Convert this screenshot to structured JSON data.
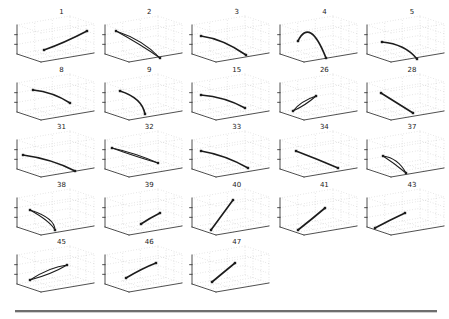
{
  "figure": {
    "background": "#ffffff",
    "kind": "grid of small 3D trajectory subplots"
  },
  "chart_data": {
    "type": "line",
    "title": "",
    "grid": "dotted",
    "ticks_labeled": false,
    "columns": 5,
    "rows": 5,
    "colors": {
      "curve": "#1c1c1c",
      "box_edge": "#3c3c3c",
      "grid_dot": "#b5b5b5",
      "title_text": "#1a1a1a",
      "divider": "#6e6e6e"
    },
    "plots": [
      {
        "label": "1",
        "style": "single",
        "points": [
          [
            32,
            42
          ],
          [
            52,
            35
          ],
          [
            75,
            23
          ]
        ]
      },
      {
        "label": "2",
        "style": "loop",
        "points": [
          [
            16,
            23
          ],
          [
            43,
            32
          ],
          [
            60,
            50
          ]
        ],
        "c2": [
          40,
          36
        ]
      },
      {
        "label": "3",
        "style": "single",
        "points": [
          [
            14,
            28
          ],
          [
            36,
            31
          ],
          [
            59,
            47
          ]
        ]
      },
      {
        "label": "4",
        "style": "single",
        "points": [
          [
            23,
            33
          ],
          [
            35,
            9
          ],
          [
            51,
            50
          ]
        ]
      },
      {
        "label": "5",
        "style": "single",
        "points": [
          [
            20,
            34
          ],
          [
            43,
            36
          ],
          [
            55,
            51
          ]
        ]
      },
      {
        "label": "8",
        "style": "single",
        "points": [
          [
            21,
            24
          ],
          [
            41,
            26
          ],
          [
            58,
            37
          ]
        ]
      },
      {
        "label": "9",
        "style": "single",
        "points": [
          [
            20,
            25
          ],
          [
            42,
            32
          ],
          [
            45,
            48
          ]
        ]
      },
      {
        "label": "15",
        "style": "single",
        "points": [
          [
            14,
            29
          ],
          [
            38,
            31
          ],
          [
            58,
            42
          ]
        ]
      },
      {
        "label": "26",
        "style": "loop",
        "points": [
          [
            18,
            45
          ],
          [
            26,
            35
          ],
          [
            41,
            30
          ]
        ],
        "c2": [
          31,
          39
        ]
      },
      {
        "label": "28",
        "style": "single",
        "points": [
          [
            19,
            27
          ],
          [
            35,
            37
          ],
          [
            51,
            47
          ]
        ]
      },
      {
        "label": "31",
        "style": "single",
        "points": [
          [
            11,
            32
          ],
          [
            40,
            36
          ],
          [
            63,
            48
          ]
        ]
      },
      {
        "label": "32",
        "style": "loop",
        "points": [
          [
            12,
            25
          ],
          [
            35,
            30
          ],
          [
            58,
            40
          ]
        ],
        "c2": [
          37,
          34
        ]
      },
      {
        "label": "33",
        "style": "single",
        "points": [
          [
            14,
            28
          ],
          [
            38,
            32
          ],
          [
            61,
            45
          ]
        ]
      },
      {
        "label": "34",
        "style": "single",
        "points": [
          [
            21,
            28
          ],
          [
            42,
            36
          ],
          [
            63,
            45
          ]
        ]
      },
      {
        "label": "37",
        "style": "loop",
        "points": [
          [
            21,
            33
          ],
          [
            36,
            35
          ],
          [
            44,
            50
          ]
        ],
        "c2": [
          32,
          40
        ]
      },
      {
        "label": "38",
        "style": "loop",
        "points": [
          [
            18,
            29
          ],
          [
            43,
            37
          ],
          [
            43,
            49
          ]
        ],
        "c2": [
          38,
          40
        ]
      },
      {
        "label": "39",
        "style": "single",
        "points": [
          [
            41,
            43
          ],
          [
            50,
            37
          ],
          [
            60,
            32
          ]
        ]
      },
      {
        "label": "40",
        "style": "single",
        "points": [
          [
            24,
            49
          ],
          [
            35,
            34
          ],
          [
            46,
            19
          ]
        ]
      },
      {
        "label": "41",
        "style": "single",
        "points": [
          [
            23,
            49
          ],
          [
            37,
            38
          ],
          [
            50,
            27
          ]
        ]
      },
      {
        "label": "43",
        "style": "single",
        "points": [
          [
            13,
            47
          ],
          [
            28,
            39
          ],
          [
            43,
            32
          ]
        ]
      },
      {
        "label": "45",
        "style": "loop",
        "points": [
          [
            18,
            42
          ],
          [
            38,
            29
          ],
          [
            55,
            27
          ]
        ],
        "c2": [
          40,
          36
        ]
      },
      {
        "label": "46",
        "style": "single",
        "points": [
          [
            26,
            40
          ],
          [
            43,
            30
          ],
          [
            56,
            25
          ]
        ]
      },
      {
        "label": "47",
        "style": "single",
        "points": [
          [
            25,
            44
          ],
          [
            37,
            34
          ],
          [
            48,
            25
          ]
        ]
      }
    ]
  },
  "divider": {
    "color": "#6e6e6e"
  }
}
